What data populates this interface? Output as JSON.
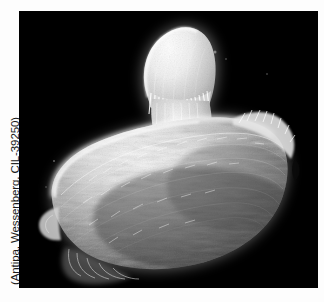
{
  "figure": {
    "credit": "(Antipa, Wessenberg, CIL-39250)",
    "organism_name": "Antipa",
    "photographer": "Wessenberg",
    "catalog_id": "CIL-39250",
    "plate": {
      "background_color": "#000000",
      "specimen_color": "#f2f2f2",
      "page_background_color": "#fdfdfd",
      "caption_color": "#1a1a1a"
    },
    "features": [
      {
        "name": "oral-cone",
        "label": "oral cone / anterior cone"
      },
      {
        "name": "membranelle-band",
        "label": "circumoral ciliary band"
      },
      {
        "name": "cell-body",
        "label": "ovoid ciliated cell body"
      },
      {
        "name": "posterior-tail",
        "label": "posterior tapering region"
      }
    ]
  }
}
